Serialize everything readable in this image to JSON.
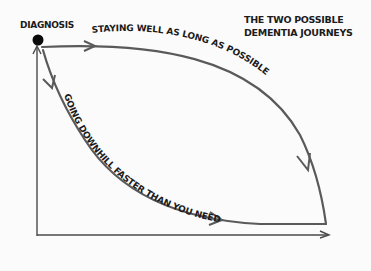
{
  "title": {
    "line1": "THE TWO POSSIBLE",
    "line2": "DEMENTIA JOURNEYS"
  },
  "start_label": "DIAGNOSIS",
  "paths": [
    {
      "name": "upper",
      "label": "STAYING WELL AS LONG AS POSSIBLE"
    },
    {
      "name": "lower",
      "label": "GOING DOWNHILL FASTER THAN YOU NEED"
    }
  ],
  "colors": {
    "line": "#5a5a5a",
    "axis": "#4a4a4a",
    "dot": "#0a0a0a",
    "text": "#1c1c1c",
    "background": "#fbfbfb"
  }
}
